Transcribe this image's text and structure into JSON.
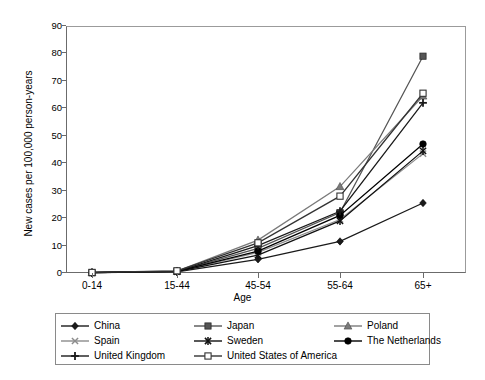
{
  "chart_data": {
    "type": "line",
    "title": "",
    "xlabel": "Age",
    "ylabel": "New cases per 100,000 person-years",
    "categories": [
      "0-14",
      "15-44",
      "45-54",
      "55-64",
      "65+"
    ],
    "ylim": [
      0,
      90
    ],
    "yticks": [
      0,
      10,
      20,
      30,
      40,
      50,
      60,
      70,
      80,
      90
    ],
    "grid": false,
    "legend_position": "bottom",
    "series": [
      {
        "name": "China",
        "marker": "diamond-filled",
        "color": "#1a1a1a",
        "values": [
          0.1,
          0.4,
          5.0,
          11.5,
          25.5
        ]
      },
      {
        "name": "Japan",
        "marker": "square-filled",
        "color": "#555555",
        "values": [
          0.1,
          0.6,
          9.0,
          22.0,
          79.0
        ]
      },
      {
        "name": "Poland",
        "marker": "triangle-filled",
        "color": "#7a7a7a",
        "values": [
          0.2,
          0.7,
          12.0,
          31.5,
          64.5
        ]
      },
      {
        "name": "Spain",
        "marker": "cross-x",
        "color": "#8c8c8c",
        "values": [
          0.1,
          0.5,
          7.5,
          19.5,
          43.5
        ]
      },
      {
        "name": "Sweden",
        "marker": "asterisk",
        "color": "#111111",
        "values": [
          0.1,
          0.5,
          6.5,
          19.0,
          44.5
        ]
      },
      {
        "name": "The Netherlands",
        "marker": "circle-filled",
        "color": "#000000",
        "values": [
          0.2,
          0.6,
          8.0,
          21.0,
          47.0
        ]
      },
      {
        "name": "United Kingdom",
        "marker": "plus",
        "color": "#1a1a1a",
        "values": [
          0.1,
          0.6,
          10.0,
          22.5,
          62.0
        ]
      },
      {
        "name": "United States of America",
        "marker": "square-hollow",
        "color": "#333333",
        "values": [
          0.2,
          0.8,
          11.0,
          28.0,
          65.5
        ]
      }
    ]
  }
}
